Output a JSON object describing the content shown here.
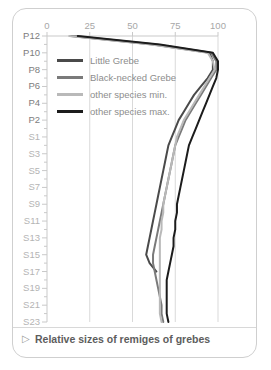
{
  "caption": {
    "marker": "▷",
    "text": "Relative sizes of remiges of grebes"
  },
  "colors": {
    "little_grebe": "#4a4a4a",
    "black_necked_grebe": "#7a7a7a",
    "other_min": "#b9b9b9",
    "other_max": "#1c1c1c",
    "axis": "#c9c9c9",
    "grid": "#d9d9d9",
    "tick_text": "#a7a7a7",
    "y_primary_text": "#7d7d7d",
    "y_secondary_text": "#b4b4b4",
    "card_border": "#cfcfcf"
  },
  "legend": {
    "position": "inside-top-left",
    "items": [
      {
        "label": "Little Grebe",
        "color": "#4a4a4a"
      },
      {
        "label": "Black-necked Grebe",
        "color": "#7a7a7a"
      },
      {
        "label": "other species min.",
        "color": "#b9b9b9"
      },
      {
        "label": "other species max.",
        "color": "#1c1c1c"
      }
    ]
  },
  "chart_data": {
    "type": "line",
    "title": "Relative sizes of remiges of grebes",
    "xlabel": "",
    "ylabel": "",
    "xlim": [
      0,
      100
    ],
    "ylim_categories_top_to_bottom": true,
    "grid": true,
    "orientation": "horizontal-value-vertical-category",
    "xticks": [
      0,
      25,
      50,
      75,
      100
    ],
    "xtick_labels": [
      "0",
      "25",
      "50",
      "75",
      "100"
    ],
    "categories": [
      "P12",
      "P11",
      "P10",
      "P9",
      "P8",
      "P7",
      "P6",
      "P5",
      "P4",
      "P3",
      "P2",
      "P1",
      "S1",
      "S2",
      "S3",
      "S4",
      "S5",
      "S6",
      "S7",
      "S8",
      "S9",
      "S10",
      "S11",
      "S12",
      "S13",
      "S14",
      "S15",
      "S16",
      "S17",
      "S18",
      "S19",
      "S20",
      "S21",
      "S22",
      "S23"
    ],
    "ytick_labels_shown": [
      "P12",
      "P10",
      "P8",
      "P6",
      "P4",
      "P2",
      "S1",
      "S3",
      "S5",
      "S7",
      "S9",
      "S11",
      "S13",
      "S15",
      "S17",
      "S19",
      "S21",
      "S23"
    ],
    "series": [
      {
        "name": "Little Grebe",
        "color": "#4a4a4a",
        "values": [
          14,
          62,
          95,
          97,
          97,
          94,
          90,
          86,
          83,
          80,
          77,
          75,
          73,
          71,
          70,
          69,
          68,
          67,
          66,
          65,
          64,
          63,
          62,
          61,
          60,
          59,
          58,
          60,
          64,
          null,
          null,
          null,
          null,
          null,
          null
        ]
      },
      {
        "name": "Black-necked Grebe",
        "color": "#7a7a7a",
        "values": [
          16,
          64,
          96,
          99,
          99,
          96,
          93,
          90,
          87,
          84,
          81,
          79,
          77,
          75,
          74,
          73,
          72,
          71,
          70,
          69,
          68,
          67,
          66,
          65,
          64,
          63,
          62,
          62,
          63,
          64,
          65,
          66,
          67,
          67,
          68
        ]
      },
      {
        "name": "other species min.",
        "color": "#b9b9b9",
        "values": [
          13,
          61,
          94,
          97,
          98,
          95,
          92,
          89,
          86,
          83,
          80,
          78,
          76,
          75,
          74,
          73,
          72,
          71,
          70,
          69,
          68,
          68,
          67,
          67,
          66,
          66,
          66,
          66,
          66,
          66,
          66,
          66,
          66,
          66,
          67
        ]
      },
      {
        "name": "other species max.",
        "color": "#1c1c1c",
        "values": [
          18,
          66,
          97,
          100,
          100,
          99,
          97,
          95,
          93,
          91,
          89,
          87,
          85,
          83,
          82,
          81,
          80,
          79,
          78,
          77,
          76,
          76,
          75,
          75,
          74,
          74,
          73,
          72,
          71,
          70,
          70,
          70,
          70,
          70,
          71
        ]
      }
    ]
  }
}
